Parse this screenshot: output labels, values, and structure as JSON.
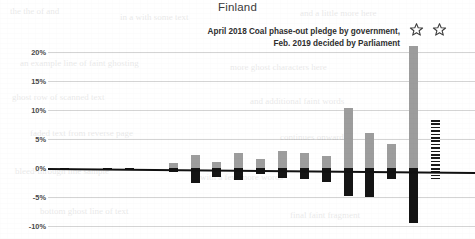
{
  "title": "Finland",
  "annotation": {
    "line1": "April 2018 Coal phase-out pledge by government,",
    "line2": "Feb. 2019 decided by Parliament"
  },
  "icons": {
    "star1": "star-icon",
    "star2": "star-icon"
  },
  "colors": {
    "positive_bar": "#9d9d9d",
    "negative_bar": "#141414",
    "hatched_bar": "#1b1b1b",
    "gridline": "#d4d4d4",
    "zero_axis": "#111111",
    "text": "#2b2b2b",
    "background": "#ffffff"
  },
  "chart_data": {
    "type": "bar",
    "title": "Finland",
    "xlabel": "",
    "ylabel": "",
    "ylim": [
      -10,
      21.5
    ],
    "yticks": [
      20,
      15,
      10,
      5,
      0,
      -5,
      -10
    ],
    "ytick_labels": [
      "20%",
      "15%",
      "10%",
      "5%",
      "0%",
      "-5%",
      "-10%"
    ],
    "grid": true,
    "legend": false,
    "annotations": [
      {
        "text": "April 2018 Coal phase-out pledge by government, Feb. 2019 decided by Parliament",
        "position": "top-right"
      },
      {
        "text": "star-icon",
        "position": "above-bar-16"
      },
      {
        "text": "star-icon",
        "position": "above-bar-17"
      }
    ],
    "categories": [
      "1",
      "2",
      "3",
      "4",
      "5",
      "6",
      "7",
      "8",
      "9",
      "10",
      "11",
      "12",
      "13",
      "14",
      "15",
      "16",
      "17",
      "18"
    ],
    "series": [
      {
        "name": "Positive",
        "color": "#9d9d9d",
        "values": [
          0,
          0,
          0,
          0,
          0,
          0.8,
          2.2,
          1.0,
          2.6,
          1.6,
          2.9,
          2.6,
          2.1,
          10.4,
          6.1,
          4.2,
          21.0,
          0
        ]
      },
      {
        "name": "Negative",
        "color": "#141414",
        "values": [
          -0.15,
          0,
          -0.3,
          -0.35,
          0,
          -0.7,
          -2.5,
          -1.6,
          -2.0,
          -1.0,
          -1.8,
          -1.9,
          -2.4,
          -4.9,
          -5.0,
          -1.9,
          -9.5,
          0
        ]
      },
      {
        "name": "Hatched projection",
        "color": "#1b1b1b",
        "hatched": true,
        "values": [
          0,
          0,
          0,
          0,
          0,
          0,
          0,
          0,
          0,
          0,
          0,
          0,
          0,
          0,
          0,
          0,
          0,
          8.2
        ],
        "negative_values": [
          0,
          0,
          0,
          0,
          0,
          0,
          0,
          0,
          0,
          0,
          0,
          0,
          0,
          0,
          0,
          0,
          0,
          -1.9
        ]
      }
    ]
  }
}
